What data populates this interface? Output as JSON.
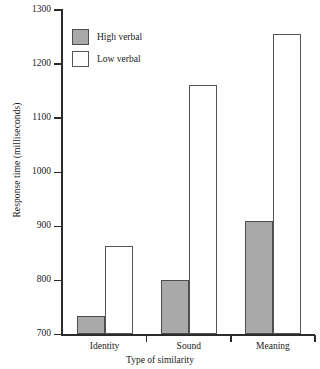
{
  "chart_data": {
    "type": "bar",
    "title": "",
    "xlabel": "Type of similarity",
    "ylabel": "Response time (milliseconds)",
    "categories": [
      "Identity",
      "Sound",
      "Meaning"
    ],
    "series": [
      {
        "name": "High verbal",
        "color": "#a9a9a9",
        "values": [
          735,
          800,
          910
        ]
      },
      {
        "name": "Low verbal",
        "color": "#ffffff",
        "values": [
          863,
          1162,
          1255
        ]
      }
    ],
    "ylim": [
      700,
      1300
    ],
    "yticks": [
      700,
      800,
      900,
      1000,
      1100,
      1200,
      1300
    ],
    "ytick_labels": [
      "700",
      "800",
      "900",
      "1000",
      "1100",
      "1200",
      "1300"
    ],
    "grid": false,
    "legend_position": "top-left"
  },
  "legend": {
    "entries": [
      {
        "label": "High verbal",
        "swatch": "gray-filled-square"
      },
      {
        "label": "Low verbal",
        "swatch": "white-outlined-square"
      }
    ]
  }
}
